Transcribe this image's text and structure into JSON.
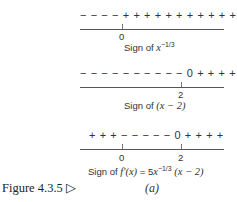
{
  "rows": [
    {
      "signs": "− − − −  + + + + + + + + + + +",
      "ticks": [
        {
          "label": "0",
          "x": 0
        }
      ],
      "caption_prefix": "Sign of ",
      "caption_var": "x",
      "caption_exp": "−1/3",
      "caption_rest": ""
    },
    {
      "signs": "− − − − − − − − − − 0 + + + +",
      "ticks": [
        {
          "label": "2",
          "x": 2
        }
      ],
      "caption_prefix": "Sign of ",
      "caption_math": "(x − 2)"
    },
    {
      "signs": "+ + +  − − − − − 0 + + + +",
      "ticks": [
        {
          "label": "0",
          "x": 0
        },
        {
          "label": "2",
          "x": 2
        }
      ],
      "caption_prefix": "Sign of ",
      "caption_f": "f′(x)",
      "caption_eq": " = 5",
      "caption_var": "x",
      "caption_exp": "−1/3",
      "caption_tail": " (x − 2)"
    }
  ],
  "figure": {
    "label": "Figure 4.3.5 ▷",
    "sublabel": "(a)"
  }
}
